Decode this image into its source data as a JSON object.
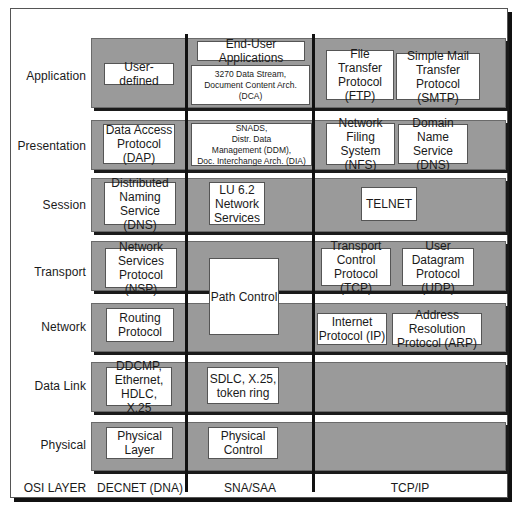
{
  "osi_layers": [
    "Application",
    "Presentation",
    "Session",
    "Transport",
    "Network",
    "Data Link",
    "Physical"
  ],
  "footer": {
    "osi": "OSI LAYER",
    "decnet": "DECNET (DNA)",
    "sna": "SNA/SAA",
    "tcpip": "TCP/IP"
  },
  "decnet": {
    "application": "User-defined",
    "presentation": "Data Access\nProtocol (DAP)",
    "session": "Distributed\nNaming Service\n(DNS)",
    "transport": "Network\nServices\nProtocol (NSP)",
    "network": "Routing\nProtocol",
    "datalink": "DDCMP,\nEthernet,\nHDLC, X.25",
    "physical": "Physical\nLayer"
  },
  "sna": {
    "application_top": "End-User Applications",
    "application": "3270 Data Stream,\nDocument Content Arch. (DCA)",
    "presentation": "SNADS,\nDistr. Data\nManagement (DDM),\nDoc. Interchange Arch. (DIA)",
    "session": "LU 6.2\nNetwork\nServices",
    "transport_network": "Path Control",
    "datalink": "SDLC, X.25,\ntoken ring",
    "physical": "Physical\nControl"
  },
  "tcpip": {
    "ftp": "File\nTransfer\nProtocol (FTP)",
    "smtp": "Simple Mail\nTransfer\nProtocol (SMTP)",
    "nfs": "Network\nFiling\nSystem (NFS)",
    "dns": "Domain\nName\nService (DNS)",
    "telnet": "TELNET",
    "tcp": "Transport\nControl\nProtocol (TCP)",
    "udp": "User\nDatagram\nProtocol (UDP)",
    "ip": "Internet\nProtocol (IP)",
    "arp": "Address Resolution\nProtocol (ARP)"
  }
}
